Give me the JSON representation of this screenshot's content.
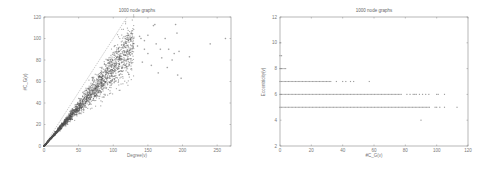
{
  "chart_data": [
    {
      "type": "scatter",
      "title": "1000 node graphs",
      "xlabel": "Degree(v)",
      "ylabel": "#C_G(v)",
      "xlim": [
        0,
        270
      ],
      "ylim": [
        0,
        120
      ],
      "xticks": [
        0,
        50,
        100,
        150,
        200,
        250
      ],
      "yticks": [
        0,
        20,
        40,
        60,
        80,
        100,
        120
      ],
      "grid": false,
      "legend": null,
      "reference_line": {
        "style": "dashed",
        "from": [
          0,
          0
        ],
        "to": [
          120,
          120
        ],
        "description": "y = x"
      },
      "series": [
        {
          "name": "nodes",
          "description": "Dense cloud along y ≈ 0.72x for x in 0–130, widening spread; sparse outliers for x 130–265",
          "dense_band": {
            "x_range": [
              0,
              130
            ],
            "slope": 0.72,
            "spread": 0.09,
            "count": 2200
          },
          "outliers": [
            [
              140,
              100
            ],
            [
              145,
              98
            ],
            [
              150,
              86
            ],
            [
              155,
              75
            ],
            [
              158,
              112
            ],
            [
              160,
              113
            ],
            [
              162,
              95
            ],
            [
              165,
              68
            ],
            [
              168,
              90
            ],
            [
              170,
              82
            ],
            [
              175,
              100
            ],
            [
              178,
              73
            ],
            [
              180,
              90
            ],
            [
              185,
              80
            ],
            [
              188,
              86
            ],
            [
              190,
              113
            ],
            [
              192,
              105
            ],
            [
              193,
              66
            ],
            [
              195,
              88
            ],
            [
              198,
              63
            ],
            [
              210,
              83
            ],
            [
              240,
              95
            ],
            [
              262,
              100
            ],
            [
              145,
              90
            ],
            [
              150,
              103
            ],
            [
              135,
              93
            ],
            [
              138,
              102
            ],
            [
              142,
              78
            ]
          ]
        }
      ],
      "plot_area_px": {
        "left": 44,
        "top": 17,
        "right": 231,
        "bottom": 146
      }
    },
    {
      "type": "scatter",
      "title": "1000 node graphs",
      "xlabel": "#C_G(v)",
      "ylabel": "Eccentricity(v)",
      "xlim": [
        0,
        120
      ],
      "ylim": [
        2,
        12
      ],
      "xticks": [
        0,
        20,
        40,
        60,
        80,
        100,
        120
      ],
      "yticks": [
        2,
        4,
        6,
        8,
        10,
        12
      ],
      "grid": false,
      "legend": null,
      "series": [
        {
          "name": "nodes",
          "rows": [
            {
              "y": 5,
              "x_dense_max": 96,
              "x_sparse": [
                99,
                100,
                102,
                105,
                113
              ]
            },
            {
              "y": 6,
              "x_dense_max": 78,
              "x_sparse": [
                81,
                83,
                85,
                86,
                87,
                89,
                91,
                93,
                95,
                100,
                101,
                105
              ]
            },
            {
              "y": 7,
              "x_dense_max": 33,
              "x_sparse": [
                36,
                40,
                42,
                45,
                47,
                57
              ]
            },
            {
              "y": 8,
              "x_dense_max": 4,
              "x_sparse": []
            },
            {
              "y": 9,
              "x_dense_max": 0,
              "x_sparse": [
                1
              ]
            },
            {
              "y": 10,
              "x_dense_max": 0,
              "x_sparse": []
            },
            {
              "y": 4,
              "x_dense_max": -1,
              "x_sparse": [
                90
              ]
            }
          ]
        }
      ],
      "plot_area_px": {
        "left": 32,
        "top": 17,
        "right": 220,
        "bottom": 146
      }
    }
  ],
  "colors": {
    "axis": "#888888",
    "point": "#555555",
    "reference_line": "#aaaaaa",
    "text": "#777777"
  }
}
